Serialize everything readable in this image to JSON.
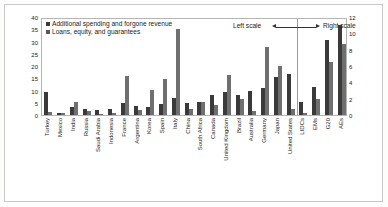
{
  "chart_data": {
    "type": "bar",
    "title": "",
    "xlabel": "",
    "ylabel": "",
    "ylim": [
      0,
      40
    ],
    "y2lim": [
      0,
      12
    ],
    "grid": false,
    "legend_position": "top-left",
    "yticks": [
      "40",
      "35",
      "30",
      "25",
      "20",
      "15",
      "10",
      "5",
      "0"
    ],
    "y2ticks": [
      "12",
      "10",
      "8",
      "6",
      "4",
      "2",
      "0"
    ],
    "categories": [
      "Turkey",
      "Mexico",
      "India",
      "Russia",
      "Saudi Arabia",
      "Indonesia",
      "France",
      "Argentina",
      "Korea",
      "Spain",
      "Italy",
      "China",
      "South Africa",
      "Canada",
      "United Kingdom",
      "Brazil",
      "Australia",
      "Germany",
      "Japan",
      "United States",
      "LIDCs",
      "EMs",
      "G20",
      "AEs"
    ],
    "left_scale_count": 20,
    "right_scale_count": 4,
    "series": [
      {
        "name": "Additional spending and forgone revenue",
        "color": "#3a3a3a",
        "values": [
          9.3,
          0.7,
          3.3,
          2.6,
          2.2,
          2.5,
          5.1,
          3.7,
          3.4,
          4.4,
          6.8,
          4.8,
          5.5,
          8.3,
          9.4,
          8.3,
          9.8,
          11.0,
          15.6,
          16.7,
          1.6,
          3.4,
          9.2,
          11.0
        ]
      },
      {
        "name": "Loans, equity, and guarantees",
        "color": "#6f6f6f",
        "values": [
          1.3,
          0.9,
          5.2,
          1.5,
          0.4,
          0.9,
          15.8,
          2.0,
          10.1,
          14.5,
          35.3,
          2.5,
          5.3,
          4.0,
          16.2,
          6.5,
          1.8,
          27.8,
          20.2,
          2.5,
          0.2,
          2.0,
          6.5,
          8.7
        ]
      }
    ],
    "annotations": {
      "left_scale": "Left scale",
      "right_scale": "Right scale"
    }
  },
  "legend": {
    "items": [
      {
        "label": "Additional spending and forgone revenue",
        "color": "#3a3a3a"
      },
      {
        "label": "Loans, equity, and guarantees",
        "color": "#585858"
      }
    ]
  }
}
